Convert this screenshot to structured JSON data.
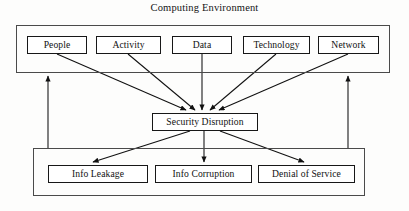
{
  "diagram": {
    "title": "Computing Environment",
    "type": "flow-diagram",
    "stroke_color": "#171717",
    "container_stroke_color": "#4a4a4a",
    "background_color": "#fdfdfc",
    "containers": [
      {
        "id": "computing-environment",
        "label": "Computing Environment",
        "label_position": "above"
      },
      {
        "id": "outcomes",
        "label": ""
      }
    ],
    "computing_environment": {
      "nodes": [
        {
          "id": "people",
          "label": "People"
        },
        {
          "id": "activity",
          "label": "Activity"
        },
        {
          "id": "data",
          "label": "Data"
        },
        {
          "id": "technology",
          "label": "Technology"
        },
        {
          "id": "network",
          "label": "Network"
        }
      ]
    },
    "central": {
      "id": "security-disruption",
      "label": "Security Disruption"
    },
    "outcomes": {
      "nodes": [
        {
          "id": "info-leakage",
          "label": "Info Leakage"
        },
        {
          "id": "info-corruption",
          "label": "Info Corruption"
        },
        {
          "id": "denial-of-service",
          "label": "Denial of Service"
        }
      ]
    },
    "edges": [
      {
        "from": "people",
        "to": "security-disruption",
        "style": "solid",
        "arrow": "end"
      },
      {
        "from": "activity",
        "to": "security-disruption",
        "style": "solid",
        "arrow": "end"
      },
      {
        "from": "data",
        "to": "security-disruption",
        "style": "solid",
        "arrow": "end"
      },
      {
        "from": "technology",
        "to": "security-disruption",
        "style": "solid",
        "arrow": "end"
      },
      {
        "from": "network",
        "to": "security-disruption",
        "style": "solid",
        "arrow": "end"
      },
      {
        "from": "security-disruption",
        "to": "info-leakage",
        "style": "solid",
        "arrow": "end"
      },
      {
        "from": "security-disruption",
        "to": "info-corruption",
        "style": "solid",
        "arrow": "end"
      },
      {
        "from": "security-disruption",
        "to": "denial-of-service",
        "style": "solid",
        "arrow": "end"
      },
      {
        "from": "outcomes",
        "to": "computing-environment",
        "style": "solid",
        "arrow": "end",
        "side": "left"
      },
      {
        "from": "outcomes",
        "to": "computing-environment",
        "style": "solid",
        "arrow": "end",
        "side": "right"
      }
    ]
  }
}
